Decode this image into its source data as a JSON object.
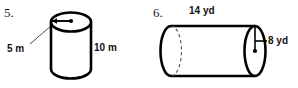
{
  "worksheet": {
    "background_color": "#ffffff",
    "ink_color": "#000000"
  },
  "problems": [
    {
      "number": "5.",
      "shape": "cylinder",
      "orientation": "vertical",
      "labels": {
        "radius": "5 m",
        "height": "10 m"
      },
      "units": "m"
    },
    {
      "number": "6.",
      "shape": "cylinder",
      "orientation": "horizontal",
      "labels": {
        "length": "14 yd",
        "radius": "8 yd"
      },
      "units": "yd"
    }
  ]
}
